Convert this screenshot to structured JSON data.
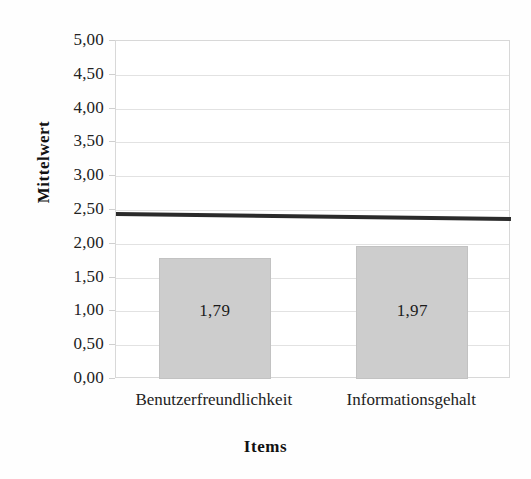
{
  "chart_data": {
    "type": "bar",
    "title": "",
    "xlabel": "Items",
    "ylabel": "Mittelwert",
    "categories": [
      "Benutzerfreundlichkeit",
      "Informationsgehalt"
    ],
    "values": [
      1.79,
      1.97
    ],
    "value_labels": [
      "1,79",
      "1,97"
    ],
    "ylim": [
      0,
      5
    ],
    "ytick_step": 0.5,
    "ytick_labels": [
      "5,00",
      "4,50",
      "4,00",
      "3,50",
      "3,00",
      "2,50",
      "2,00",
      "1,50",
      "1,00",
      "0,50",
      "0,00"
    ],
    "ytick_values": [
      5.0,
      4.5,
      4.0,
      3.5,
      3.0,
      2.5,
      2.0,
      1.5,
      1.0,
      0.5,
      0.0
    ],
    "grid": true,
    "grid_axis": "y",
    "legend": false,
    "decimal_separator": ",",
    "annotations": [
      {
        "name": "reference-line",
        "type": "horizontal-line",
        "value": 2.48,
        "label": ""
      }
    ],
    "colors": {
      "bar_fill": "#cdcdcd",
      "bar_border": "#c2c2c2",
      "gridline": "#e2e2e2",
      "plot_border": "#d8d8d8",
      "reference_line": "#2b2b2b",
      "text": "#1a1a1a",
      "background": "#ffffff"
    }
  }
}
